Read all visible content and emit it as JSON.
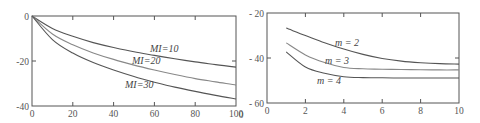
{
  "chart_data": [
    {
      "type": "line",
      "title": "",
      "xlabel": "",
      "ylabel": "",
      "xlim": [
        0,
        100
      ],
      "ylim": [
        -40,
        0
      ],
      "grid": false,
      "legend": "inline curve labels",
      "x_ticks": [
        0,
        20,
        40,
        60,
        80,
        100
      ],
      "x_tick_labels": [
        "0",
        "20",
        "40",
        "60",
        "80",
        "100"
      ],
      "y_ticks": [
        0,
        -20,
        -40
      ],
      "y_tick_labels": [
        "0",
        "-20",
        "-40"
      ],
      "x": [
        0,
        10,
        20,
        30,
        40,
        50,
        60,
        70,
        80,
        90,
        100
      ],
      "series": [
        {
          "name": "MI=10",
          "label": "MI=10",
          "color": "#555555",
          "values": [
            0,
            -5.5,
            -9,
            -11.8,
            -14,
            -15.9,
            -17.5,
            -19,
            -20.4,
            -21.6,
            -22.7
          ]
        },
        {
          "name": "MI=20",
          "label": "MI=20",
          "color": "#888888",
          "values": [
            0,
            -8,
            -12.8,
            -16.4,
            -19.3,
            -21.8,
            -24,
            -26,
            -27.8,
            -29.3,
            -30.7
          ]
        },
        {
          "name": "MI=30",
          "label": "MI=30",
          "color": "#555555",
          "values": [
            0,
            -10.5,
            -16.5,
            -20.7,
            -24,
            -26.9,
            -29.4,
            -31.6,
            -33.5,
            -35.3,
            -36.9
          ]
        }
      ]
    },
    {
      "type": "line",
      "title": "",
      "xlabel": "",
      "ylabel": "",
      "xlim": [
        0,
        10
      ],
      "ylim": [
        -60,
        -20
      ],
      "grid": false,
      "legend": "inline curve labels",
      "x_ticks": [
        0,
        2,
        4,
        6,
        8,
        10
      ],
      "x_tick_labels": [
        "0",
        "2",
        "4",
        "6",
        "8",
        "10"
      ],
      "y_ticks": [
        -20,
        -40,
        -60
      ],
      "y_tick_labels": [
        "- 20",
        "- 40",
        "- 60"
      ],
      "x": [
        1,
        2,
        3,
        4,
        5,
        6,
        7,
        8,
        9,
        10
      ],
      "series": [
        {
          "name": "m = 2",
          "label": "m = 2",
          "color": "#555555",
          "values": [
            -26.7,
            -30,
            -33.2,
            -36,
            -38.4,
            -40.2,
            -41.4,
            -42.1,
            -42.5,
            -42.7
          ]
        },
        {
          "name": "m = 3",
          "label": "m = 3",
          "color": "#888888",
          "values": [
            -33.3,
            -38.6,
            -42,
            -44.2,
            -44.8,
            -45,
            -45.1,
            -45.2,
            -45.3,
            -45.3
          ]
        },
        {
          "name": "m = 4",
          "label": "m = 4",
          "color": "#555555",
          "values": [
            -37.3,
            -44,
            -46.8,
            -48.3,
            -48.7,
            -48.8,
            -48.9,
            -48.9,
            -48.9,
            -48.9
          ]
        }
      ]
    }
  ],
  "stray_label": "0",
  "colors": {
    "axis": "#555555",
    "background": "#ffffff"
  }
}
